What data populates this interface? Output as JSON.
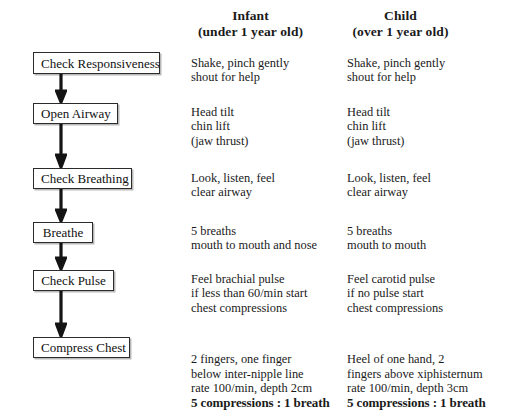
{
  "page": {
    "background_color": "#ffffff",
    "text_color": "#1a1a1a",
    "box_border_color": "#2b2b2b",
    "box_shadow_color": "#b9b9b9"
  },
  "columns": [
    {
      "id": "infant",
      "title": "Infant",
      "subtitle": "(under 1 year old)"
    },
    {
      "id": "child",
      "title": "Child",
      "subtitle": "(over 1 year old)"
    }
  ],
  "steps": [
    {
      "id": "check-responsiveness",
      "box_label": "Check Responsiveness",
      "infant": "Shake, pinch gently\nshout for help",
      "child": "Shake, pinch gently\nshout for help"
    },
    {
      "id": "open-airway",
      "box_label": "Open Airway",
      "infant": "Head tilt\nchin lift\n(jaw thrust)",
      "child": "Head tilt\nchin lift\n(jaw thrust)"
    },
    {
      "id": "check-breathing",
      "box_label": "Check Breathing",
      "infant": "Look, listen, feel\nclear airway",
      "child": "Look, listen, feel\nclear airway"
    },
    {
      "id": "breathe",
      "box_label": "Breathe",
      "infant": "5 breaths\nmouth to mouth and nose",
      "child": "5 breaths\nmouth to mouth"
    },
    {
      "id": "check-pulse",
      "box_label": "Check Pulse",
      "infant": "Feel brachial pulse\nif less than 60/min start\nchest compressions",
      "child": "Feel carotid pulse\nif no pulse start\nchest compressions"
    },
    {
      "id": "compress-chest",
      "box_label": "Compress Chest",
      "infant": "2 fingers, one finger\nbelow inter-nipple line\nrate 100/min, depth 2cm",
      "infant_emphasis": "5 compressions : 1 breath",
      "child": "Heel of one hand, 2\nfingers above xiphisternum\nrate 100/min, depth 3cm",
      "child_emphasis": "5 compressions : 1 breath"
    }
  ],
  "arrows": {
    "icon": "down-arrow-icon",
    "count": 5,
    "color": "#141414"
  }
}
